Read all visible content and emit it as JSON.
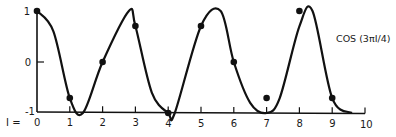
{
  "chart_data": {
    "type": "line",
    "title": "",
    "series_label": "COS (3πI/4)",
    "xlabel": "I =",
    "ylabel": "",
    "xlim": [
      0,
      10
    ],
    "ylim": [
      -1,
      1
    ],
    "x_ticks": [
      "0",
      "1",
      "2",
      "3",
      "4",
      "5",
      "6",
      "7",
      "8",
      "9",
      "10"
    ],
    "y_ticks": [
      "1",
      "0",
      "-1"
    ],
    "grid": false,
    "legend_position": "inline-right",
    "series": [
      {
        "name": "cos(3πI/4) samples",
        "x": [
          0,
          1,
          2,
          3,
          4,
          5,
          6,
          7,
          8,
          9
        ],
        "values": [
          1,
          -0.707,
          0,
          0.707,
          -1,
          0.707,
          0,
          -0.707,
          1,
          -0.707
        ]
      },
      {
        "name": "interpolated curve",
        "x": [
          0,
          0.5,
          1,
          1.4,
          2,
          2.8,
          3,
          3.5,
          4,
          4.2,
          5,
          5.6,
          6,
          6.5,
          7,
          7.4,
          8,
          8.4,
          9,
          9.6
        ],
        "values": [
          1,
          0.6,
          -0.707,
          -1,
          0,
          1,
          0.707,
          -0.6,
          -1,
          -1,
          0.707,
          1,
          0,
          -0.8,
          -1,
          -0.707,
          0.7,
          1,
          -0.707,
          -1
        ]
      }
    ]
  },
  "colors": {
    "ink": "#111111",
    "background": "#ffffff"
  }
}
